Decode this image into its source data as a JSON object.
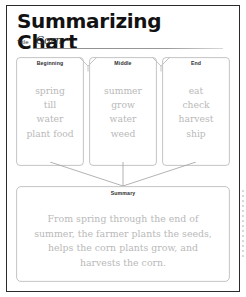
{
  "worksheet": {
    "heading": "Summarizing Chart",
    "title_label": "Title",
    "title_value": "Corn",
    "ink_color": "#b9b9b9",
    "border_color": "#2b2b2b"
  },
  "columns": [
    {
      "header": "Beginning",
      "words": [
        "spring",
        "till",
        "water",
        "plant food"
      ]
    },
    {
      "header": "Middle",
      "words": [
        "summer",
        "grow",
        "water",
        "weed"
      ]
    },
    {
      "header": "End",
      "words": [
        "eat",
        "check",
        "harvest",
        "ship"
      ]
    }
  ],
  "summary": {
    "header": "Summary",
    "text": "From spring through the end of summer, the farmer plants the seeds, helps the corn plants grow, and harvests the corn."
  }
}
